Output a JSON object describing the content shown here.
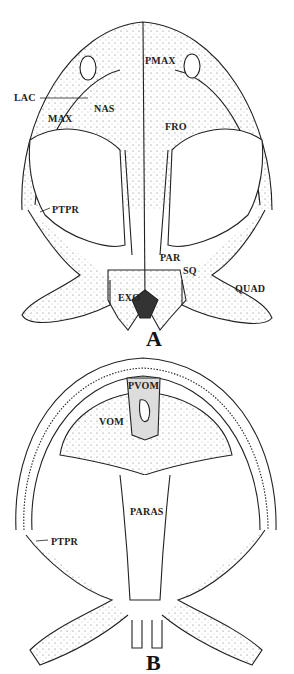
{
  "figure": {
    "panels": [
      {
        "id": "A",
        "view": "dorsal skull",
        "letter": "A",
        "labels": {
          "pmax": "PMAX",
          "lac": "LAC",
          "nas": "NAS",
          "max": "MAX",
          "fro": "FRO",
          "ptpr": "PTPR",
          "par": "PAR",
          "sq": "SQ",
          "quad": "QUAD",
          "exo": "EXO"
        }
      },
      {
        "id": "B",
        "view": "ventral skull",
        "letter": "B",
        "labels": {
          "pvom": "PVOM",
          "vom": "VOM",
          "paras": "PARAS",
          "ptpr": "PTPR"
        }
      }
    ]
  },
  "colors": {
    "ink": "#222222",
    "paper": "#ffffff"
  }
}
